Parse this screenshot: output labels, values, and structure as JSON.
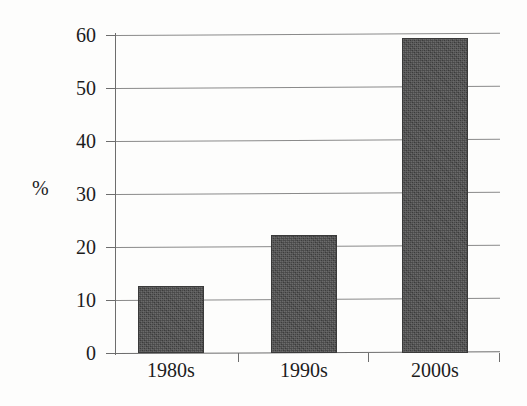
{
  "chart_data": {
    "type": "bar",
    "title": "",
    "subtitle": "",
    "xlabel": "",
    "ylabel": "%",
    "categories": [
      "1980s",
      "1990s",
      "2000s"
    ],
    "values": [
      12.7,
      22.2,
      59.5
    ],
    "ylim": [
      0,
      60
    ],
    "yticks": [
      0,
      10,
      20,
      30,
      40,
      50,
      60
    ],
    "ytick_labels": [
      "0",
      "10",
      "20",
      "30",
      "40",
      "50",
      "60"
    ],
    "grid": true,
    "legend": false,
    "legend_position": "none",
    "annotations": [],
    "series": [
      {
        "name": "",
        "values": [
          12.7,
          22.2,
          59.5
        ]
      }
    ]
  },
  "axes": {
    "y_unit_label": "%",
    "y_tick_labels": [
      "60",
      "50",
      "40",
      "30",
      "20",
      "10",
      "0"
    ],
    "x_tick_labels": [
      "1980s",
      "1990s",
      "2000s"
    ]
  },
  "style": {
    "bar_fill": "#484848",
    "bar_stroke": "#3a3a3a",
    "gridline_color": "#8a8a8a",
    "axis_color": "#6d6d6d",
    "text_color": "#1c1c1c",
    "background": "#fdfdfc"
  }
}
